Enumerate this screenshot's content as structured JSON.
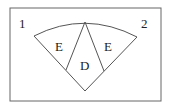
{
  "diagram": {
    "corner_labels": {
      "left": "1",
      "right": "2"
    },
    "regions": {
      "left": "E",
      "center": "D",
      "right": "E"
    },
    "colors": {
      "stroke": "#555555",
      "frame": "#666666",
      "background": "#ffffff"
    }
  }
}
